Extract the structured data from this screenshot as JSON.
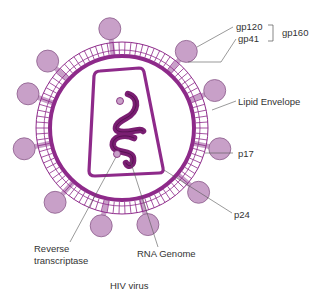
{
  "title": "HIV virus",
  "colors": {
    "membrane": "#8e2a8a",
    "knob_fill": "#c8a0c8",
    "knob_stroke": "#8a5a8a",
    "rna": "#7a1e72",
    "rna_dark": "#3d0a3a",
    "leader": "#555555",
    "text": "#333333"
  },
  "labels": {
    "gp120": "gp120",
    "gp41": "gp41",
    "gp160": "gp160",
    "lipid_envelope": "Lipid Envelope",
    "p17": "p17",
    "p24": "p24",
    "reverse_transcriptase_line1": "Reverse",
    "reverse_transcriptase_line2": "transcriptase",
    "rna_genome": "RNA Genome"
  }
}
